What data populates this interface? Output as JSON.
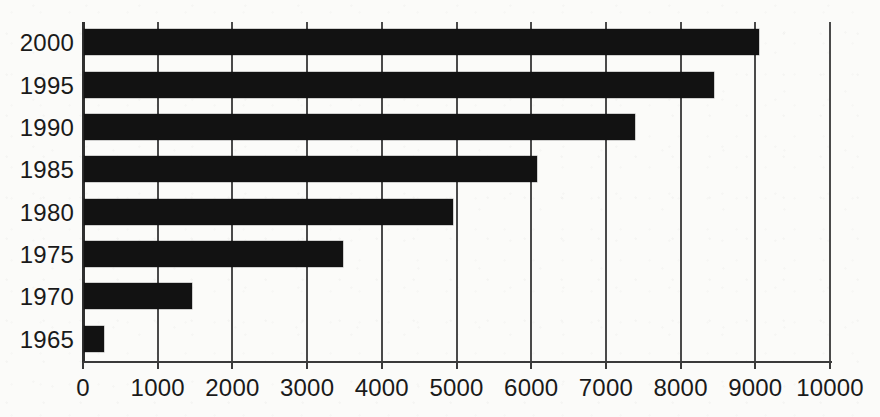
{
  "chart_data": {
    "type": "bar",
    "orientation": "horizontal",
    "title": "",
    "subtitle": "",
    "xlabel": "",
    "ylabel": "",
    "categories": [
      "2000",
      "1995",
      "1990",
      "1985",
      "1980",
      "1975",
      "1970",
      "1965"
    ],
    "values": [
      9030,
      8440,
      7370,
      6060,
      4940,
      3470,
      1450,
      270
    ],
    "series": [
      {
        "name": "",
        "values": [
          9030,
          8440,
          7370,
          6060,
          4940,
          3470,
          1450,
          270
        ]
      }
    ],
    "xlim": [
      0,
      10000
    ],
    "x_ticks": [
      0,
      1000,
      2000,
      3000,
      4000,
      5000,
      6000,
      7000,
      8000,
      9000,
      10000
    ],
    "x_tick_labels": [
      "0",
      "1000",
      "2000",
      "3000",
      "4000",
      "5000",
      "6000",
      "7000",
      "8000",
      "9000",
      "10000"
    ],
    "y_tick_labels": [
      "2000",
      "1995",
      "1990",
      "1985",
      "1980",
      "1975",
      "1970",
      "1965"
    ],
    "grid": "vertical",
    "legend": null,
    "legend_position": "none",
    "bar_color": "#121212",
    "axis_color": "#3a3a3a",
    "grid_color": "#4a4a4a",
    "background_color": "#fbfbf9"
  }
}
